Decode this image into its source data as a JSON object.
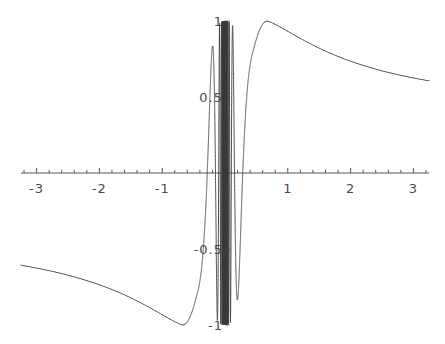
{
  "chart_data": {
    "type": "line",
    "title": "",
    "subtitle": "",
    "xlabel": "",
    "ylabel": "",
    "grid": false,
    "legend": false,
    "legend_position": "none",
    "xlim": [
      -3.25,
      3.25
    ],
    "ylim": [
      -1.05,
      1.05
    ],
    "xticks_major": [
      -3,
      -2,
      -1,
      1,
      2,
      3
    ],
    "xticklabels": [
      "-3",
      "-2",
      "-1",
      "1",
      "2",
      "3"
    ],
    "yticks_major": [
      -1,
      -0.5,
      0.5,
      1
    ],
    "yticklabels": [
      "-1",
      "-0.5",
      "0.5",
      "1"
    ],
    "x_minor_tick_step": 0.2,
    "y_minor_tick_step": 0.1,
    "axis_color": "#555555",
    "curve_color": "#3a3a3a",
    "curve_width": 0.9,
    "series": [
      {
        "name": "f(x)",
        "description": "smooth sigmoid-like outer branches with dense high-frequency oscillation clustered near x = 0, amplitude bounded by +/-1",
        "formula": "sin(1/x) blended with smooth envelope; oscillation dense for |x| < 0.45",
        "samples_x": [
          -3.2,
          -3.0,
          -2.75,
          -2.5,
          -2.25,
          -2.0,
          -1.75,
          -1.5,
          -1.25,
          -1.0,
          -0.9,
          -0.8,
          -0.7,
          -0.6,
          -0.5,
          -0.45,
          -0.4,
          -0.3,
          -0.2,
          -0.1,
          0.0,
          0.1,
          0.2,
          0.3,
          0.4,
          0.45,
          0.5,
          0.6,
          0.7,
          0.8,
          0.9,
          1.0,
          1.25,
          1.5,
          1.75,
          2.0,
          2.25,
          2.5,
          2.75,
          3.0,
          3.2
        ],
        "samples_y": [
          -0.61,
          -0.645,
          -0.695,
          -0.75,
          -0.805,
          -0.86,
          -0.91,
          -0.95,
          -0.98,
          -0.998,
          -1.0,
          -0.99,
          -0.95,
          -0.84,
          -0.55,
          -0.2,
          0.35,
          0.7,
          -0.4,
          0.9,
          0.0,
          -0.9,
          0.4,
          -0.7,
          -0.35,
          0.2,
          0.55,
          0.84,
          0.95,
          0.99,
          1.0,
          0.998,
          0.98,
          0.95,
          0.91,
          0.86,
          0.805,
          0.75,
          0.695,
          0.645,
          0.61
        ]
      }
    ],
    "features": {
      "global_max_value": 1.0,
      "global_max_x": 0.67,
      "global_min_value": -1.0,
      "global_min_x": -0.67,
      "left_endpoint_value": -0.61,
      "right_endpoint_value": 0.61,
      "oscillation_band_x": [
        -0.42,
        0.42
      ],
      "symmetry": "odd"
    }
  },
  "axes": {
    "x_axis_name": "horizontal-axis",
    "y_axis_name": "vertical-axis"
  }
}
